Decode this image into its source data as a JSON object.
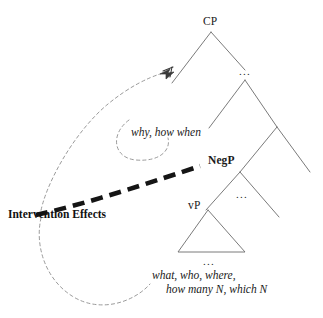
{
  "figure": {
    "type": "syntax-tree-diagram",
    "caption": "",
    "colors": {
      "branch": "#6b6b6b",
      "text": "#1a1a1a",
      "dashed_arc": "#8a8a8a",
      "thick_dashed": "#1a1a1a",
      "background": "#ffffff"
    }
  },
  "nodes": {
    "cp": {
      "label": "CP",
      "x": 211,
      "y": 22
    },
    "ellipsis_c": {
      "label": "...",
      "x": 245,
      "y": 72
    },
    "negp": {
      "label": "NegP",
      "x": 231,
      "y": 158
    },
    "ellipsis_neg": {
      "label": "...",
      "x": 240,
      "y": 192
    },
    "vp": {
      "label": "vP",
      "x": 196,
      "y": 205
    },
    "ellipsis_vp": {
      "label": "...",
      "x": 203,
      "y": 258
    }
  },
  "annotations": {
    "moved_adjuncts": {
      "label": "why, how when",
      "x": 131,
      "y": 126
    },
    "intervention": {
      "label": "Intervention Effects",
      "x": 8,
      "y": 209
    },
    "wh_arguments": {
      "line1": "what, who, where,",
      "line2": "how many N, which N",
      "x": 152,
      "y": 270
    }
  },
  "arcs": [
    {
      "name": "long-movement-arc",
      "description": "thin dashed arc from lower-left up to arrowhead on CP left branch",
      "has_arrowhead": true
    },
    {
      "name": "adjunct-loop-arc",
      "description": "small thin dashed loop beneath why-how-when label",
      "has_arrowhead": false
    },
    {
      "name": "argument-movement-arc",
      "description": "thin dashed arc from intervention label down around to wh-argument block",
      "has_arrowhead": false
    },
    {
      "name": "intervention-barrier",
      "description": "thick bold dashed line from Intervention Effects up-right to NegP",
      "has_arrowhead": false
    }
  ]
}
